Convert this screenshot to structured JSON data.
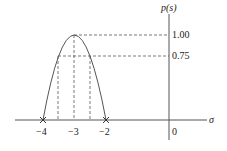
{
  "diagram": {
    "y_axis_label": "p(s)",
    "x_axis_label": "σ",
    "y_ticks": [
      {
        "label": "1.00",
        "value": 1.0
      },
      {
        "label": "0.75",
        "value": 0.75
      }
    ],
    "x_ticks": [
      {
        "label": "−4"
      },
      {
        "label": "−3"
      },
      {
        "label": "−2"
      },
      {
        "label": "0"
      }
    ],
    "curve": "inverted parabola from σ=-4 to σ=-2, peak 1.00 at σ=-3",
    "markers": [
      "x at -4",
      "x at -2"
    ],
    "colors": {
      "line": "#555555",
      "text": "#222222"
    }
  }
}
